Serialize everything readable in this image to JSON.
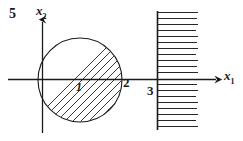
{
  "figure": {
    "number_label": "5",
    "axes": {
      "x_axis_label": "x",
      "x_axis_subscript": "1",
      "y_axis_label": "x",
      "y_axis_subscript": "2",
      "origin": [
        42,
        79
      ]
    },
    "annotations": [
      {
        "name": "circle-center-label",
        "text": "1"
      },
      {
        "name": "circle-right-intercept-label",
        "text": "2"
      },
      {
        "name": "halfplane-boundary-label",
        "text": "3"
      }
    ],
    "regions": [
      {
        "name": "hatched-disk",
        "shape": "circle",
        "center_px": [
          80,
          80
        ],
        "radius_px": 42,
        "hatch": "diagonal-45"
      },
      {
        "name": "hatched-halfplane",
        "shape": "half-plane",
        "boundary_x_px": 157,
        "hatch": "horizontal"
      }
    ],
    "colors": {
      "ink": "#1a1a1a",
      "background": "#ffffff"
    }
  }
}
